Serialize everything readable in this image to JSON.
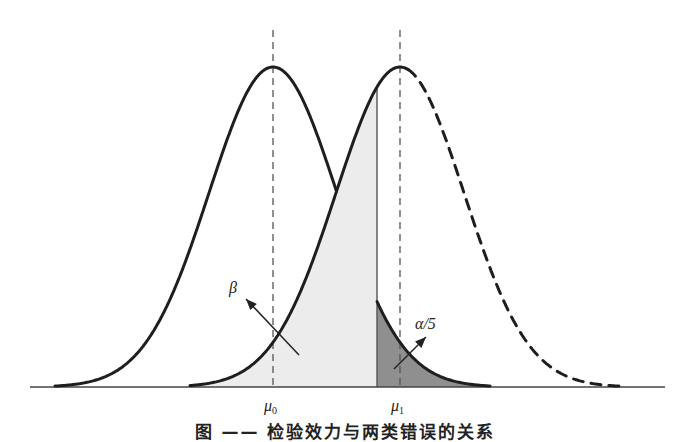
{
  "figure": {
    "caption": "图 —— 检验效力与两类错误的关系",
    "baseline": {
      "y": 387,
      "x_start": 30,
      "x_end": 665
    },
    "amplitude": 320,
    "sigma": 64,
    "colors": {
      "curve": "#1e1e1e",
      "light_fill": "#ececec",
      "dark_fill": "#8f8f8f",
      "dashed_line": "#555555",
      "axis": "#444444"
    },
    "critical_x": 377,
    "distributions": [
      {
        "name": "H0",
        "mean_x": 273,
        "label_main": "μ",
        "label_sub": "0",
        "label_x": 264,
        "label_y": 398,
        "x_min": 55,
        "x_max": 490
      },
      {
        "name": "H1",
        "mean_x": 400,
        "label_main": "μ",
        "label_sub": "1",
        "label_x": 391,
        "label_y": 398,
        "x_min": 190,
        "x_max": 625
      }
    ],
    "annotations": [
      {
        "id": "beta",
        "text": "β",
        "x": 229,
        "y": 280,
        "arrow": {
          "x1": 299,
          "y1": 355,
          "x2": 246,
          "y2": 299
        }
      },
      {
        "id": "alpha",
        "text": "α/5",
        "x": 415,
        "y": 316,
        "arrow": {
          "x1": 394,
          "y1": 369,
          "x2": 426,
          "y2": 337
        }
      }
    ]
  }
}
